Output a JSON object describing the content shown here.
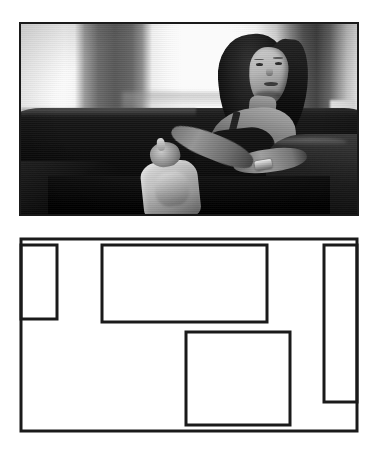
{
  "figure": {
    "background_color": "#ffffff",
    "width": 378,
    "height": 451,
    "panel_count": 2
  },
  "photo_panel": {
    "label": "photograph",
    "caption": "Grayscale photograph of a woman with long dark hair seated on a dark sofa, turning to look over her shoulder toward the camera, with a bright window behind her and a pale handbag in her lap",
    "border_color": "#1a1a1a",
    "border_width": 2,
    "frame": {
      "x": 19,
      "y": 22,
      "width": 340,
      "height": 194
    },
    "palette": {
      "window_bright": "#fbfbf9",
      "column_dark": "#5e5e5c",
      "sofa_dark": "#1a1a1a",
      "skin_light": "#cfcac2",
      "bag_light": "#ded8d0"
    },
    "scene_elements": [
      {
        "name": "bright-window-background",
        "tone": "blown-out white"
      },
      {
        "name": "dark-vertical-column",
        "tone": "mid gray"
      },
      {
        "name": "sofa-back",
        "tone": "near black"
      },
      {
        "name": "sofa-arm-left",
        "tone": "dark gray"
      },
      {
        "name": "sofa-arm-right",
        "tone": "dark gray"
      },
      {
        "name": "woman-head-and-hair",
        "tone": "dark"
      },
      {
        "name": "woman-face",
        "tone": "light"
      },
      {
        "name": "woman-bare-shoulder-and-arm",
        "tone": "light gray"
      },
      {
        "name": "wristwatch",
        "tone": "bright highlight"
      },
      {
        "name": "handbag",
        "tone": "pale gray"
      }
    ]
  },
  "diagram_panel": {
    "label": "line diagram",
    "caption": "Schematic line drawing of the photograph showing the frame outline and three rectangular region outlines",
    "stroke_color": "#1a1a1a",
    "fill_color": "#ffffff",
    "outer_frame": {
      "name": "outer-frame",
      "x": 3,
      "y": 3,
      "width": 336,
      "height": 192,
      "stroke_width": 3
    },
    "regions": [
      {
        "name": "left-narrow-region",
        "x": 3,
        "y": 9,
        "width": 36,
        "height": 74,
        "stroke_width": 3
      },
      {
        "name": "upper-center-region",
        "x": 84,
        "y": 9,
        "width": 165,
        "height": 77,
        "stroke_width": 3
      },
      {
        "name": "lower-center-region",
        "x": 168,
        "y": 96,
        "width": 104,
        "height": 93,
        "stroke_width": 3
      },
      {
        "name": "right-narrow-region",
        "x": 306,
        "y": 9,
        "width": 33,
        "height": 157,
        "stroke_width": 3
      }
    ]
  }
}
